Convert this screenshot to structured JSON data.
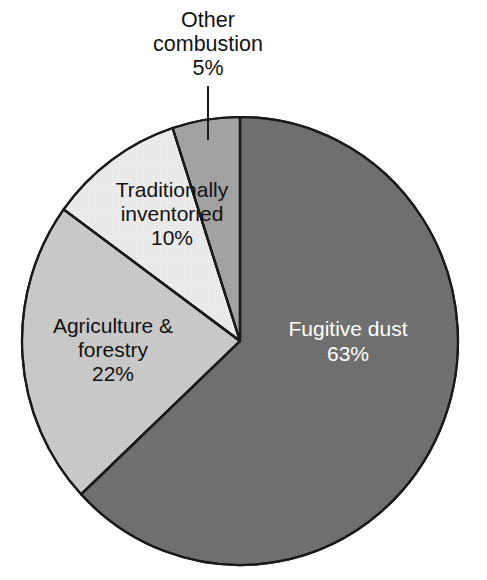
{
  "chart_data": {
    "type": "pie",
    "title": "",
    "subtitle": "",
    "xlabel": "",
    "ylabel": "",
    "legend_position": "none",
    "grid": false,
    "total_percent": 100,
    "start_angle_deg": 0,
    "direction": "clockwise",
    "categories": [
      "Fugitive dust",
      "Agriculture & forestry",
      "Traditionally inventoried",
      "Other combustion"
    ],
    "values": [
      63,
      22,
      10,
      5
    ],
    "value_labels": [
      "63%",
      "22%",
      "10%",
      "5%"
    ],
    "slices": [
      {
        "name": "Fugitive dust",
        "value": 63,
        "value_label": "63%",
        "color": "#6f6f6f",
        "label_lines": [
          "Fugitive dust",
          "63%"
        ],
        "label_color": "#ffffff",
        "label_placement": "inside"
      },
      {
        "name": "Agriculture & forestry",
        "value": 22,
        "value_label": "22%",
        "color": "#c9c9c9",
        "label_lines": [
          "Agriculture &",
          "forestry",
          "22%"
        ],
        "label_color": "#121212",
        "label_placement": "inside"
      },
      {
        "name": "Traditionally inventoried",
        "value": 10,
        "value_label": "10%",
        "color": "#ebebeb",
        "label_lines": [
          "Traditionally",
          "inventoried",
          "10%"
        ],
        "label_color": "#121212",
        "label_placement": "inside"
      },
      {
        "name": "Other combustion",
        "value": 5,
        "value_label": "5%",
        "color": "#a2a2a2",
        "label_lines": [
          "Other",
          "combustion",
          "5%"
        ],
        "label_color": "#121212",
        "label_placement": "callout"
      }
    ],
    "colors": {
      "outline": "#1a1a1a",
      "background": "#ffffff",
      "fugitive_dust": "#6f6f6f",
      "agriculture_forestry": "#c9c9c9",
      "traditionally_inventoried": "#ebebeb",
      "other_combustion": "#a2a2a2"
    }
  },
  "labels": {
    "fugitive_dust": {
      "line1": "Fugitive dust",
      "line2": "63%"
    },
    "agriculture_forestry": {
      "line1": "Agriculture &",
      "line2": "forestry",
      "line3": "22%"
    },
    "traditionally_inventoried": {
      "line1": "Traditionally",
      "line2": "inventoried",
      "line3": "10%"
    },
    "other_combustion": {
      "line1": "Other",
      "line2": "combustion",
      "line3": "5%"
    }
  }
}
